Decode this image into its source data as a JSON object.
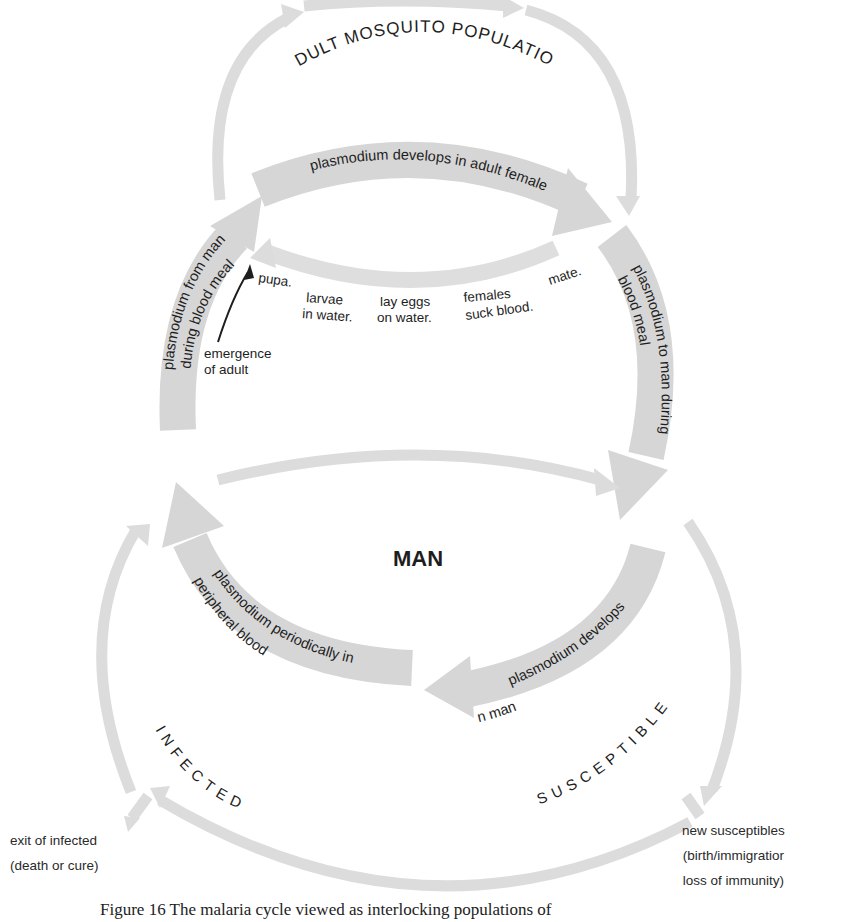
{
  "diagram": {
    "mosquito_population_label": "ADULT MOSQUITO POPULATION",
    "man_label": "MAN",
    "infected_label": "INFECTED",
    "susceptible_label": "SUSCEPTIBLE",
    "bands": {
      "develops_in_female": "plasmodium develops in adult female",
      "to_man_line1": "plasmodium to man during",
      "to_man_line2": "blood meal",
      "from_man_line1": "plasmodium from man",
      "from_man_line2": "during  blood meal",
      "develops_in_man_line1": "plasmodium develops",
      "develops_in_man_line2": "in man",
      "periodically_line1": "plasmodium periodically in",
      "periodically_line2": "peripheral blood"
    },
    "mosquito_stages": {
      "pupa": "pupa.",
      "larvae_line1": "larvae",
      "larvae_line2": "in water.",
      "eggs_line1": "lay eggs",
      "eggs_line2": "on water.",
      "females_line1": "females",
      "females_line2": "suck blood.",
      "mate": "mate."
    },
    "emergence": {
      "line1": "emergence",
      "line2": "of adult"
    },
    "exit_infected": {
      "line1": "exit of infected",
      "line2": "(death or cure)"
    },
    "new_susceptibles": {
      "line1": "new susceptibles",
      "line2": "(birth/immigratior",
      "line3": "loss of immunity)"
    },
    "colors": {
      "arrow_fill": "#d6d6d6",
      "text": "#1e1e1e"
    }
  },
  "caption": "Figure 16   The malaria cycle viewed as interlocking populations of"
}
